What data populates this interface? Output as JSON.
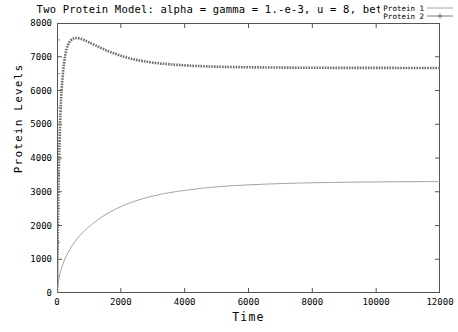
{
  "chart_data": {
    "type": "line",
    "title": "Two Protein Model: alpha = gamma = 1.-e-3, u = 8, beta = 10",
    "xlabel": "Time",
    "ylabel": "Protein Levels",
    "xlim": [
      0,
      12000
    ],
    "ylim": [
      0,
      8000
    ],
    "xticks": [
      0,
      2000,
      4000,
      6000,
      8000,
      10000,
      12000
    ],
    "yticks": [
      0,
      1000,
      2000,
      3000,
      4000,
      5000,
      6000,
      7000,
      8000
    ],
    "grid": false,
    "legend_position": "top-right",
    "series": [
      {
        "name": "Protein 1",
        "style": "solid-thin",
        "color": "#9a9a9a",
        "x": [
          0,
          60,
          150,
          300,
          500,
          750,
          1000,
          1400,
          1800,
          2200,
          2600,
          3000,
          3500,
          4000,
          4500,
          5000,
          5500,
          6000,
          6500,
          7000,
          7500,
          8000,
          8500,
          9000,
          9500,
          10000,
          10500,
          11000,
          11500,
          12000
        ],
        "y": [
          0,
          420,
          760,
          1120,
          1440,
          1740,
          1960,
          2250,
          2470,
          2640,
          2770,
          2870,
          2970,
          3040,
          3100,
          3145,
          3180,
          3205,
          3225,
          3242,
          3255,
          3266,
          3274,
          3281,
          3287,
          3291,
          3295,
          3298,
          3300,
          3302
        ]
      },
      {
        "name": "Protein 2",
        "style": "dotted-thick",
        "color": "#6e6e6e",
        "x": [
          0,
          50,
          110,
          180,
          260,
          340,
          430,
          520,
          620,
          720,
          850,
          1000,
          1200,
          1450,
          1700,
          2000,
          2350,
          2700,
          3100,
          3500,
          4000,
          4500,
          5000,
          5500,
          6000,
          6500,
          7000,
          7500,
          8000,
          8500,
          9000,
          9500,
          10000,
          10500,
          11000,
          11500,
          12000
        ],
        "y": [
          0,
          3250,
          5350,
          6450,
          7050,
          7340,
          7480,
          7540,
          7555,
          7540,
          7495,
          7430,
          7340,
          7230,
          7130,
          7030,
          6935,
          6870,
          6815,
          6780,
          6745,
          6722,
          6706,
          6695,
          6688,
          6683,
          6679,
          6676,
          6674,
          6672,
          6671,
          6670,
          6669,
          6669,
          6668,
          6668,
          6668
        ]
      }
    ]
  },
  "legend": {
    "entries": [
      {
        "label": "Protein 1"
      },
      {
        "label": "Protein 2"
      }
    ]
  }
}
